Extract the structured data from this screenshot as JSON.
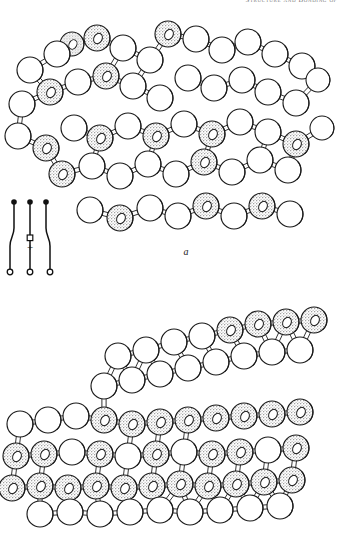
{
  "page": {
    "running_head": "Structure and Bonding of",
    "background_color": "#ffffff",
    "width": 343,
    "height": 533
  },
  "figure": {
    "type": "ball-and-stick crystal structure plate",
    "atom_styles": {
      "open_sphere_label": "open sphere",
      "open_sphere_fill": "#ffffff",
      "stippled_sphere_label": "stippled sphere",
      "stippled_sphere_fill": "#cfcfcf",
      "outline_color": "#1a1a1a",
      "bond_color": "#2a2a2a"
    },
    "panels": [
      {
        "id": "a",
        "label": "a",
        "legend": {
          "name": "bond-orientation-symbol-a",
          "sign": "+",
          "top_markers": [
            "filled",
            "filled",
            "filled"
          ],
          "bottom_markers": [
            "open",
            "open",
            "open"
          ],
          "middle_marker": "open-square",
          "stems": 3
        }
      },
      {
        "id": "b",
        "label": "b",
        "legend": {
          "name": "bond-orientation-symbol-b",
          "sign": "−",
          "top_markers": [
            "filled",
            "filled"
          ],
          "bottom_markers": [
            "open",
            "open",
            "open"
          ],
          "middle_marker": "filled",
          "stems": 3
        }
      }
    ]
  },
  "chart_data": {
    "type": "scatter",
    "xlabel": "",
    "ylabel": "",
    "legend": [
      "open sphere",
      "stippled sphere"
    ],
    "panels": [
      {
        "name": "a",
        "description": "Open three-dimensional lattice viewed obliquely; alternating open and stippled spheres joined by cylindrical bonds forming a puckered layered framework.",
        "atoms": [
          {
            "x": 30,
            "y": 62,
            "r": 13,
            "type": "open"
          },
          {
            "x": 57,
            "y": 46,
            "r": 13,
            "type": "open"
          },
          {
            "x": 72,
            "y": 36,
            "r": 12,
            "type": "stippled"
          },
          {
            "x": 97,
            "y": 30,
            "r": 13,
            "type": "stippled"
          },
          {
            "x": 123,
            "y": 40,
            "r": 13,
            "type": "open"
          },
          {
            "x": 150,
            "y": 52,
            "r": 13,
            "type": "open"
          },
          {
            "x": 168,
            "y": 26,
            "r": 13,
            "type": "stippled"
          },
          {
            "x": 196,
            "y": 31,
            "r": 13,
            "type": "open"
          },
          {
            "x": 222,
            "y": 42,
            "r": 13,
            "type": "open"
          },
          {
            "x": 248,
            "y": 34,
            "r": 13,
            "type": "open"
          },
          {
            "x": 275,
            "y": 46,
            "r": 13,
            "type": "open"
          },
          {
            "x": 302,
            "y": 58,
            "r": 13,
            "type": "open"
          },
          {
            "x": 22,
            "y": 96,
            "r": 13,
            "type": "open"
          },
          {
            "x": 50,
            "y": 84,
            "r": 13,
            "type": "stippled"
          },
          {
            "x": 78,
            "y": 74,
            "r": 13,
            "type": "open"
          },
          {
            "x": 106,
            "y": 68,
            "r": 13,
            "type": "stippled"
          },
          {
            "x": 133,
            "y": 78,
            "r": 13,
            "type": "open"
          },
          {
            "x": 160,
            "y": 90,
            "r": 13,
            "type": "open"
          },
          {
            "x": 188,
            "y": 70,
            "r": 13,
            "type": "open"
          },
          {
            "x": 214,
            "y": 80,
            "r": 13,
            "type": "open"
          },
          {
            "x": 242,
            "y": 72,
            "r": 13,
            "type": "open"
          },
          {
            "x": 268,
            "y": 84,
            "r": 13,
            "type": "open"
          },
          {
            "x": 296,
            "y": 95,
            "r": 13,
            "type": "open"
          },
          {
            "x": 318,
            "y": 72,
            "r": 12,
            "type": "open"
          },
          {
            "x": 18,
            "y": 128,
            "r": 13,
            "type": "open"
          },
          {
            "x": 46,
            "y": 140,
            "r": 13,
            "type": "stippled"
          },
          {
            "x": 74,
            "y": 120,
            "r": 13,
            "type": "open"
          },
          {
            "x": 100,
            "y": 130,
            "r": 13,
            "type": "stippled"
          },
          {
            "x": 128,
            "y": 118,
            "r": 13,
            "type": "open"
          },
          {
            "x": 156,
            "y": 128,
            "r": 13,
            "type": "stippled"
          },
          {
            "x": 184,
            "y": 116,
            "r": 13,
            "type": "open"
          },
          {
            "x": 212,
            "y": 126,
            "r": 13,
            "type": "stippled"
          },
          {
            "x": 240,
            "y": 114,
            "r": 13,
            "type": "open"
          },
          {
            "x": 268,
            "y": 124,
            "r": 13,
            "type": "open"
          },
          {
            "x": 296,
            "y": 136,
            "r": 13,
            "type": "stippled"
          },
          {
            "x": 322,
            "y": 120,
            "r": 12,
            "type": "open"
          },
          {
            "x": 62,
            "y": 166,
            "r": 13,
            "type": "stippled"
          },
          {
            "x": 92,
            "y": 158,
            "r": 13,
            "type": "open"
          },
          {
            "x": 120,
            "y": 168,
            "r": 13,
            "type": "open"
          },
          {
            "x": 148,
            "y": 156,
            "r": 13,
            "type": "open"
          },
          {
            "x": 176,
            "y": 166,
            "r": 13,
            "type": "open"
          },
          {
            "x": 204,
            "y": 154,
            "r": 13,
            "type": "stippled"
          },
          {
            "x": 232,
            "y": 164,
            "r": 13,
            "type": "open"
          },
          {
            "x": 260,
            "y": 152,
            "r": 13,
            "type": "open"
          },
          {
            "x": 288,
            "y": 162,
            "r": 13,
            "type": "open"
          },
          {
            "x": 90,
            "y": 202,
            "r": 13,
            "type": "open"
          },
          {
            "x": 120,
            "y": 210,
            "r": 13,
            "type": "stippled"
          },
          {
            "x": 150,
            "y": 200,
            "r": 13,
            "type": "open"
          },
          {
            "x": 178,
            "y": 208,
            "r": 13,
            "type": "open"
          },
          {
            "x": 206,
            "y": 198,
            "r": 13,
            "type": "stippled"
          },
          {
            "x": 234,
            "y": 208,
            "r": 13,
            "type": "open"
          },
          {
            "x": 262,
            "y": 198,
            "r": 13,
            "type": "stippled"
          },
          {
            "x": 290,
            "y": 206,
            "r": 13,
            "type": "open"
          }
        ]
      },
      {
        "name": "b",
        "description": "Flatter layered lattice; upper sheet of open spheres above a dense lower sheet of stippled spheres, bonds drawn as vertical and oblique rods.",
        "atoms": [
          {
            "x": 118,
            "y": 60,
            "r": 13,
            "type": "open"
          },
          {
            "x": 146,
            "y": 54,
            "r": 13,
            "type": "open"
          },
          {
            "x": 174,
            "y": 46,
            "r": 13,
            "type": "open"
          },
          {
            "x": 202,
            "y": 40,
            "r": 13,
            "type": "open"
          },
          {
            "x": 230,
            "y": 34,
            "r": 13,
            "type": "stippled"
          },
          {
            "x": 258,
            "y": 28,
            "r": 13,
            "type": "stippled"
          },
          {
            "x": 286,
            "y": 26,
            "r": 13,
            "type": "stippled"
          },
          {
            "x": 314,
            "y": 24,
            "r": 13,
            "type": "stippled"
          },
          {
            "x": 104,
            "y": 90,
            "r": 13,
            "type": "open"
          },
          {
            "x": 132,
            "y": 84,
            "r": 13,
            "type": "open"
          },
          {
            "x": 160,
            "y": 78,
            "r": 13,
            "type": "open"
          },
          {
            "x": 188,
            "y": 72,
            "r": 13,
            "type": "open"
          },
          {
            "x": 216,
            "y": 66,
            "r": 13,
            "type": "open"
          },
          {
            "x": 244,
            "y": 60,
            "r": 13,
            "type": "open"
          },
          {
            "x": 272,
            "y": 56,
            "r": 13,
            "type": "open"
          },
          {
            "x": 300,
            "y": 54,
            "r": 13,
            "type": "open"
          },
          {
            "x": 20,
            "y": 128,
            "r": 13,
            "type": "open"
          },
          {
            "x": 48,
            "y": 124,
            "r": 13,
            "type": "open"
          },
          {
            "x": 76,
            "y": 120,
            "r": 13,
            "type": "open"
          },
          {
            "x": 104,
            "y": 124,
            "r": 13,
            "type": "stippled"
          },
          {
            "x": 132,
            "y": 128,
            "r": 13,
            "type": "stippled"
          },
          {
            "x": 160,
            "y": 126,
            "r": 13,
            "type": "stippled"
          },
          {
            "x": 188,
            "y": 124,
            "r": 13,
            "type": "stippled"
          },
          {
            "x": 216,
            "y": 122,
            "r": 13,
            "type": "stippled"
          },
          {
            "x": 244,
            "y": 120,
            "r": 13,
            "type": "stippled"
          },
          {
            "x": 272,
            "y": 118,
            "r": 13,
            "type": "stippled"
          },
          {
            "x": 300,
            "y": 116,
            "r": 13,
            "type": "stippled"
          },
          {
            "x": 16,
            "y": 160,
            "r": 13,
            "type": "stippled"
          },
          {
            "x": 44,
            "y": 158,
            "r": 13,
            "type": "stippled"
          },
          {
            "x": 72,
            "y": 156,
            "r": 13,
            "type": "open"
          },
          {
            "x": 100,
            "y": 158,
            "r": 13,
            "type": "stippled"
          },
          {
            "x": 128,
            "y": 160,
            "r": 13,
            "type": "open"
          },
          {
            "x": 156,
            "y": 158,
            "r": 13,
            "type": "stippled"
          },
          {
            "x": 184,
            "y": 156,
            "r": 13,
            "type": "open"
          },
          {
            "x": 212,
            "y": 158,
            "r": 13,
            "type": "stippled"
          },
          {
            "x": 240,
            "y": 156,
            "r": 13,
            "type": "stippled"
          },
          {
            "x": 268,
            "y": 154,
            "r": 13,
            "type": "open"
          },
          {
            "x": 296,
            "y": 152,
            "r": 13,
            "type": "stippled"
          },
          {
            "x": 12,
            "y": 192,
            "r": 13,
            "type": "stippled"
          },
          {
            "x": 40,
            "y": 190,
            "r": 13,
            "type": "stippled"
          },
          {
            "x": 68,
            "y": 192,
            "r": 13,
            "type": "stippled"
          },
          {
            "x": 96,
            "y": 190,
            "r": 13,
            "type": "stippled"
          },
          {
            "x": 124,
            "y": 192,
            "r": 13,
            "type": "stippled"
          },
          {
            "x": 152,
            "y": 190,
            "r": 13,
            "type": "stippled"
          },
          {
            "x": 180,
            "y": 188,
            "r": 13,
            "type": "stippled"
          },
          {
            "x": 208,
            "y": 190,
            "r": 13,
            "type": "stippled"
          },
          {
            "x": 236,
            "y": 188,
            "r": 13,
            "type": "stippled"
          },
          {
            "x": 264,
            "y": 186,
            "r": 13,
            "type": "stippled"
          },
          {
            "x": 292,
            "y": 184,
            "r": 13,
            "type": "stippled"
          },
          {
            "x": 40,
            "y": 218,
            "r": 13,
            "type": "open"
          },
          {
            "x": 70,
            "y": 216,
            "r": 13,
            "type": "open"
          },
          {
            "x": 100,
            "y": 218,
            "r": 13,
            "type": "open"
          },
          {
            "x": 130,
            "y": 216,
            "r": 13,
            "type": "open"
          },
          {
            "x": 160,
            "y": 214,
            "r": 13,
            "type": "open"
          },
          {
            "x": 190,
            "y": 216,
            "r": 13,
            "type": "open"
          },
          {
            "x": 220,
            "y": 214,
            "r": 13,
            "type": "open"
          },
          {
            "x": 250,
            "y": 212,
            "r": 13,
            "type": "open"
          },
          {
            "x": 280,
            "y": 210,
            "r": 13,
            "type": "open"
          }
        ]
      }
    ]
  }
}
